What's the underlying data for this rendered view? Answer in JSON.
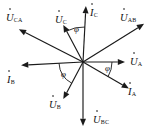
{
  "diagram": {
    "type": "phasor-diagram",
    "title": "",
    "origin": {
      "x": 83,
      "y": 62
    },
    "background_color": "#ffffff",
    "stroke_color": "#1a1a1a",
    "vectors": [
      {
        "id": "u-ca",
        "symbol": "U",
        "subscript": "CA",
        "overdot": true,
        "quantity": "voltage",
        "angle_deg": 153,
        "length": 72,
        "label_x": 6,
        "label_y": 8
      },
      {
        "id": "u-c",
        "symbol": "U",
        "subscript": "C",
        "overdot": true,
        "quantity": "voltage",
        "angle_deg": 118,
        "length": 42,
        "label_x": 55,
        "label_y": 10
      },
      {
        "id": "i-c",
        "symbol": "I",
        "subscript": "C",
        "overdot": true,
        "quantity": "current",
        "angle_deg": 87,
        "length": 56,
        "label_x": 90,
        "label_y": 3
      },
      {
        "id": "u-ab",
        "symbol": "U",
        "subscript": "AB",
        "overdot": true,
        "quantity": "voltage",
        "angle_deg": 32,
        "length": 72,
        "label_x": 120,
        "label_y": 8
      },
      {
        "id": "u-a",
        "symbol": "U",
        "subscript": "A",
        "overdot": true,
        "quantity": "voltage",
        "angle_deg": 0,
        "length": 42,
        "label_x": 130,
        "label_y": 52
      },
      {
        "id": "i-a",
        "symbol": "I",
        "subscript": "A",
        "overdot": true,
        "quantity": "current",
        "angle_deg": -30,
        "length": 53,
        "label_x": 128,
        "label_y": 82
      },
      {
        "id": "u-bc",
        "symbol": "U",
        "subscript": "BC",
        "overdot": true,
        "quantity": "voltage",
        "angle_deg": -90,
        "length": 64,
        "label_x": 93,
        "label_y": 110
      },
      {
        "id": "u-b",
        "symbol": "U",
        "subscript": "B",
        "overdot": true,
        "quantity": "voltage",
        "angle_deg": -118,
        "length": 42,
        "label_x": 49,
        "label_y": 95
      },
      {
        "id": "i-b",
        "symbol": "I",
        "subscript": "B",
        "overdot": true,
        "quantity": "current",
        "angle_deg": -177,
        "length": 62,
        "label_x": 7,
        "label_y": 70
      }
    ],
    "angle_arcs": [
      {
        "id": "phi-c",
        "label": "φ",
        "from_deg": 87,
        "to_deg": 118,
        "radius": 35,
        "label_x": 74,
        "label_y": 25
      },
      {
        "id": "phi-a",
        "label": "φ",
        "from_deg": -30,
        "to_deg": 0,
        "radius": 29,
        "label_x": 105,
        "label_y": 64
      },
      {
        "id": "phi-b",
        "label": "φ",
        "from_deg": -177,
        "to_deg": -118,
        "radius": 24,
        "label_x": 61,
        "label_y": 70
      }
    ]
  }
}
